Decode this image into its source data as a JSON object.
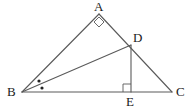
{
  "figure": {
    "type": "euclidean-geometry-diagram",
    "width": 194,
    "height": 112,
    "background_color": "#ffffff",
    "stroke_color": "#5a5a5a",
    "label_color": "#1a1a1a",
    "stroke_width": 1.1
  },
  "points": [
    {
      "name": "A",
      "label": "A",
      "x": 99,
      "y": 14,
      "label_x": 94,
      "label_y": 0,
      "role": "apex-vertex"
    },
    {
      "name": "B",
      "label": "B",
      "x": 22,
      "y": 92,
      "label_x": 7,
      "label_y": 85,
      "role": "bottom-left-vertex"
    },
    {
      "name": "C",
      "label": "C",
      "x": 172,
      "y": 92,
      "label_x": 176,
      "label_y": 85,
      "role": "bottom-right-vertex"
    },
    {
      "name": "D",
      "label": "D",
      "x": 131,
      "y": 45,
      "label_x": 133,
      "label_y": 31,
      "role": "point-on-AC"
    },
    {
      "name": "E",
      "label": "E",
      "x": 131,
      "y": 92,
      "label_x": 126,
      "label_y": 95,
      "role": "foot-of-perpendicular-on-BC"
    }
  ],
  "segments": [
    {
      "name": "segment-BA",
      "from": "B",
      "to": "A",
      "x1": 22,
      "y1": 92,
      "x2": 99,
      "y2": 14
    },
    {
      "name": "segment-AC",
      "from": "A",
      "to": "C",
      "x1": 99,
      "y1": 14,
      "x2": 172,
      "y2": 92
    },
    {
      "name": "segment-BC",
      "from": "B",
      "to": "C",
      "x1": 22,
      "y1": 92,
      "x2": 172,
      "y2": 92
    },
    {
      "name": "segment-BD",
      "from": "B",
      "to": "D",
      "x1": 22,
      "y1": 92,
      "x2": 131,
      "y2": 45
    },
    {
      "name": "segment-DE",
      "from": "D",
      "to": "E",
      "x1": 131,
      "y1": 45,
      "x2": 131,
      "y2": 92
    }
  ],
  "angle_marks": [
    {
      "name": "right-angle-mark-A",
      "at_point": "A",
      "kind": "right-angle-diamond",
      "center_x": 99,
      "center_y": 22,
      "size": 5
    },
    {
      "name": "right-angle-mark-E",
      "at_point": "E",
      "kind": "right-angle-square",
      "corner_x": 131,
      "corner_y": 92,
      "size": 8,
      "opens": "up-left"
    }
  ],
  "angle_dots": [
    {
      "name": "angle-bisector-dot-upper",
      "x": 39,
      "y": 81,
      "radius": 1.6
    },
    {
      "name": "angle-bisector-dot-lower",
      "x": 42,
      "y": 88,
      "radius": 1.6
    }
  ]
}
